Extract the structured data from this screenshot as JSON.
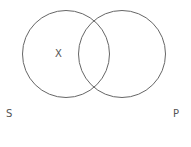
{
  "diagram": {
    "type": "venn",
    "circles": [
      {
        "name": "left",
        "cx": 66,
        "cy": 54,
        "r": 44
      },
      {
        "name": "right",
        "cx": 122,
        "cy": 54,
        "r": 44
      }
    ],
    "stroke_color": "#666666",
    "marker": "X",
    "labels": {
      "left": "S",
      "right": "P"
    }
  }
}
